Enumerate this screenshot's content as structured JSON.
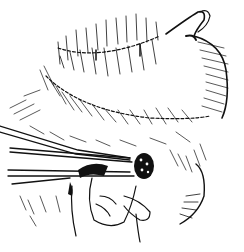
{
  "figure": {
    "type": "pen-and-ink surgical illustration",
    "subjects": [
      "stomach with suture lines",
      "surgical forceps",
      "hand",
      "tissue mass"
    ],
    "colors": {
      "ink": "#111111",
      "background": "#ffffff"
    }
  }
}
